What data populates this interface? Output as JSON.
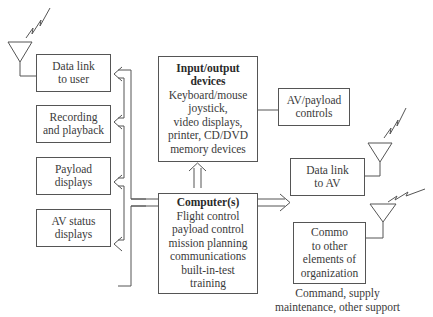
{
  "diagram": {
    "left_boxes": [
      {
        "lines": [
          "Data link",
          "to user"
        ]
      },
      {
        "lines": [
          "Recording",
          "and playback"
        ]
      },
      {
        "lines": [
          "Payload",
          "displays"
        ]
      },
      {
        "lines": [
          "AV status",
          "displays"
        ]
      }
    ],
    "io_devices": {
      "title_lines": [
        "Input/output",
        "devices"
      ],
      "lines": [
        "Keyboard/mouse",
        "joystick,",
        "video displays,",
        "printer, CD/DVD",
        "memory devices"
      ]
    },
    "computers": {
      "title": "Computer(s)",
      "lines": [
        "Flight control",
        "payload control",
        "mission planning",
        "communications",
        "built-in-test",
        "training"
      ]
    },
    "av_payload_controls": {
      "lines": [
        "AV/payload",
        "controls"
      ]
    },
    "data_link_av": {
      "lines": [
        "Data link",
        "to AV"
      ]
    },
    "commo": {
      "lines": [
        "Commo",
        "to other",
        "elements of",
        "organization"
      ]
    },
    "commo_caption": [
      "Command, supply",
      "maintenance, other support"
    ],
    "icons": [
      "antenna-icon",
      "lightning-signal-icon",
      "double-arrow-icon"
    ]
  }
}
